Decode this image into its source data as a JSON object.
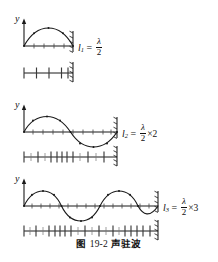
{
  "figure": {
    "caption_prefix": "图",
    "caption_number": "19-2",
    "caption_title": "声驻波",
    "background_color": "#ffffff",
    "ink_color": "#1a1a1a",
    "width": 218,
    "height": 262
  },
  "axis": {
    "y_label": "y"
  },
  "panels": [
    {
      "id": "harmonic-1",
      "y_label": "y",
      "label": {
        "var": "l",
        "sub": "1",
        "equals": "=",
        "numerator": "λ",
        "denominator": "2",
        "multiplier": ""
      },
      "wave": {
        "half_periods": 1,
        "amplitude": 11,
        "length": 58,
        "node_dots": 5
      },
      "ruler": {
        "tick_count": 5,
        "pattern": "uniform"
      }
    },
    {
      "id": "harmonic-2",
      "y_label": "y",
      "label": {
        "var": "l",
        "sub": "2",
        "equals": "=",
        "numerator": "λ",
        "denominator": "2",
        "multiplier": "×2"
      },
      "wave": {
        "half_periods": 2,
        "amplitude": 11,
        "length": 110,
        "node_dots": 9
      },
      "ruler": {
        "tick_count": 13,
        "pattern": "clustered"
      }
    },
    {
      "id": "harmonic-3",
      "y_label": "y",
      "label": {
        "var": "l",
        "sub": "3",
        "equals": "=",
        "numerator": "λ",
        "denominator": "2",
        "multiplier": "×3"
      },
      "wave": {
        "half_periods": 3,
        "amplitude": 11,
        "length": 156,
        "node_dots": 13
      },
      "ruler": {
        "tick_count": 21,
        "pattern": "clustered"
      }
    }
  ],
  "wall": {
    "name": "hatched-boundary",
    "hatch_count": 5
  }
}
